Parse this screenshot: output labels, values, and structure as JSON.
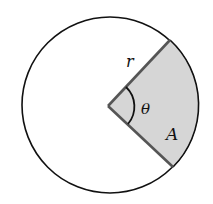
{
  "diagram": {
    "colors": {
      "background": "#ffffff",
      "circle_stroke": "#111111",
      "sector_fill": "#d6d6d6",
      "sector_stroke": "#555555",
      "angle_arc_stroke": "#111111",
      "label": "#111111"
    },
    "circle": {
      "cx": 110,
      "cy": 105,
      "r": 88
    },
    "sector": {
      "vertex": [
        108,
        106
      ],
      "end_upper": [
        170,
        40
      ],
      "end_lower": [
        173,
        167
      ]
    },
    "labels": {
      "radius": "r",
      "angle": "θ",
      "area": "A"
    }
  }
}
